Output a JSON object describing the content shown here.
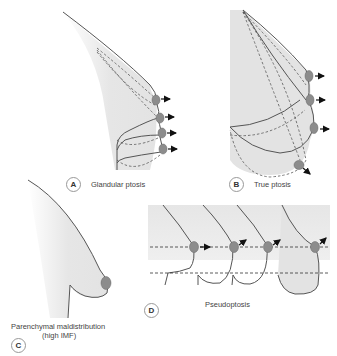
{
  "panels": {
    "A": {
      "letter": "A",
      "caption": "Glandular ptosis"
    },
    "B": {
      "letter": "B",
      "caption": "True ptosis"
    },
    "C": {
      "letter": "C",
      "caption_line1": "Parenchymal maldistribution",
      "caption_line2": "(high IMF)"
    },
    "D": {
      "letter": "D",
      "caption": "Pseudoptosis"
    }
  },
  "colors": {
    "fill": "#e3e3e3",
    "outline": "#555555",
    "nipple": "#8c8c8c",
    "arrow": "#111111"
  }
}
